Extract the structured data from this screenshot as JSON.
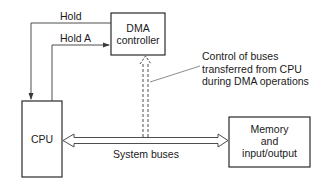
{
  "diagram": {
    "type": "block-diagram",
    "title": "",
    "colors": {
      "line": "#2a2a2a",
      "background": "#ffffff",
      "text": "#1a1a1a"
    },
    "nodes": {
      "dma": {
        "line1": "DMA",
        "line2": "controller"
      },
      "cpu": {
        "label": "CPU"
      },
      "memory": {
        "line1": "Memory",
        "line2": "and",
        "line3": "input/output"
      }
    },
    "signals": {
      "hold": "Hold",
      "hold_a": "Hold A"
    },
    "bus": {
      "label": "System buses"
    },
    "annotation": {
      "line1": "Control of buses",
      "line2": "transferred from CPU",
      "line3": "during DMA operations"
    },
    "edges": [
      {
        "from": "dma",
        "to": "cpu",
        "label": "Hold",
        "style": "solid-arrow"
      },
      {
        "from": "cpu",
        "to": "dma",
        "label": "Hold A",
        "style": "solid-arrow"
      },
      {
        "from": "cpu",
        "to": "memory",
        "label": "System buses",
        "style": "double-line-bidirectional"
      },
      {
        "from": "system-buses",
        "to": "dma",
        "label": "Control of buses transferred from CPU during DMA operations",
        "style": "dashed-double-line-arrow"
      }
    ]
  }
}
